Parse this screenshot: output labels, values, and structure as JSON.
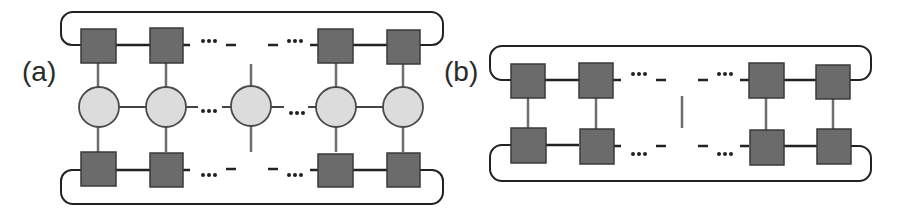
{
  "panels": [
    {
      "id": "a",
      "label": "(a)",
      "description": "Two rows of square tensors sandwiching a middle row of circular tensors, with periodic boundary loops; middle circle has open vertical legs",
      "top_row": [
        "square",
        "square",
        "ellipsis",
        "gap",
        "ellipsis",
        "square",
        "square"
      ],
      "middle_row": [
        "circle",
        "circle",
        "ellipsis",
        "circle-open-legs",
        "ellipsis",
        "circle",
        "circle"
      ],
      "bottom_row": [
        "square",
        "square",
        "ellipsis",
        "gap",
        "ellipsis",
        "square",
        "square"
      ]
    },
    {
      "id": "b",
      "label": "(b)",
      "description": "Two rows of square tensors connected vertically, with periodic boundary loops; center shows an open vertical bond",
      "top_row": [
        "square",
        "square",
        "ellipsis",
        "gap",
        "ellipsis",
        "square",
        "square"
      ],
      "bottom_row": [
        "square",
        "square",
        "ellipsis",
        "gap",
        "ellipsis",
        "square",
        "square"
      ]
    }
  ],
  "ellipsis_glyph": "•••",
  "colors": {
    "square_fill": "#6b6b6b",
    "square_stroke": "#3a3a3a",
    "circle_fill": "#dcdcdc",
    "circle_stroke": "#4a4a4a",
    "bond_dark": "#222222",
    "bond_gray": "#6e6e6e",
    "label": "#2a2a2a"
  }
}
